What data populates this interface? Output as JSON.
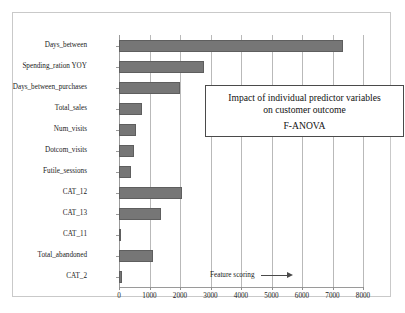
{
  "chart_data": {
    "type": "bar",
    "orientation": "horizontal",
    "title": "Impact of individual predictor variables on customer outcome",
    "title_lines": [
      "Impact of individual predictor variables",
      "on customer outcome"
    ],
    "subtitle": "F-ANOVA",
    "xlabel": "",
    "ylabel": "",
    "xlim": [
      0,
      8000
    ],
    "x_ticks": [
      0,
      1000,
      2000,
      3000,
      4000,
      5000,
      6000,
      7000,
      8000
    ],
    "x_tick_labels": [
      "0",
      "1000",
      "2000",
      "3000",
      "4000",
      "5000",
      "6000",
      "7000",
      "8000"
    ],
    "grid": "vertical",
    "legend": "none",
    "bar_color": "#767676",
    "bar_edge_color": "#5e5e5e",
    "annotation": {
      "text": "Feature scoring",
      "arrow": "right-arrow"
    },
    "categories": [
      "Days_between",
      "Spending_ration YOY",
      "Days_between_purchases",
      "Total_sales",
      "Num_visits",
      "Dotcom_visits",
      "Futile_sessions",
      "CAT_12",
      "CAT_13",
      "CAT_11",
      "Total_abandoned",
      "CAT_2"
    ],
    "values": [
      7350,
      2780,
      2000,
      750,
      550,
      480,
      380,
      2060,
      1380,
      60,
      1120,
      100
    ]
  },
  "figure": {
    "frame_color": "#c9c9c9",
    "background": "#ffffff"
  }
}
